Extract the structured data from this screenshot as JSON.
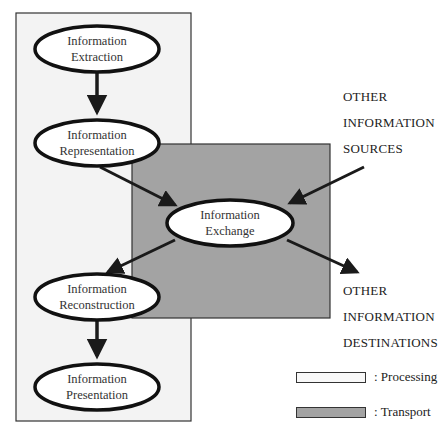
{
  "colors": {
    "processing_fill": "#f3f3f3",
    "transport_fill": "#a3a3a3",
    "border": "#333333",
    "arrow": "#1a1a1a",
    "node_fill": "#ffffff"
  },
  "nodes": [
    {
      "id": "extraction",
      "line1": "Information",
      "line2": "Extraction"
    },
    {
      "id": "representation",
      "line1": "Information",
      "line2": "Representation"
    },
    {
      "id": "exchange",
      "line1": "Information",
      "line2": "Exchange"
    },
    {
      "id": "reconstruction",
      "line1": "Information",
      "line2": "Reconstruction"
    },
    {
      "id": "presentation",
      "line1": "Information",
      "line2": "Presentation"
    }
  ],
  "external": {
    "sources": [
      "OTHER",
      "INFORMATION",
      "SOURCES"
    ],
    "destinations": [
      "OTHER",
      "INFORMATION",
      "DESTINATIONS"
    ]
  },
  "legend": {
    "processing": ": Processing",
    "transport": ": Transport"
  }
}
